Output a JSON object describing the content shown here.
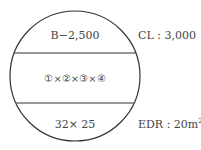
{
  "diagram": {
    "top_text": "B−2,500",
    "middle_text": "①×②×③×④",
    "bottom_text": "32× 25",
    "right_top_text": "CL : 3,000",
    "right_bottom_prefix": "EDR : 20m",
    "right_bottom_sup": "2"
  },
  "colors": {
    "stroke": "#333333",
    "text": "#444444"
  }
}
